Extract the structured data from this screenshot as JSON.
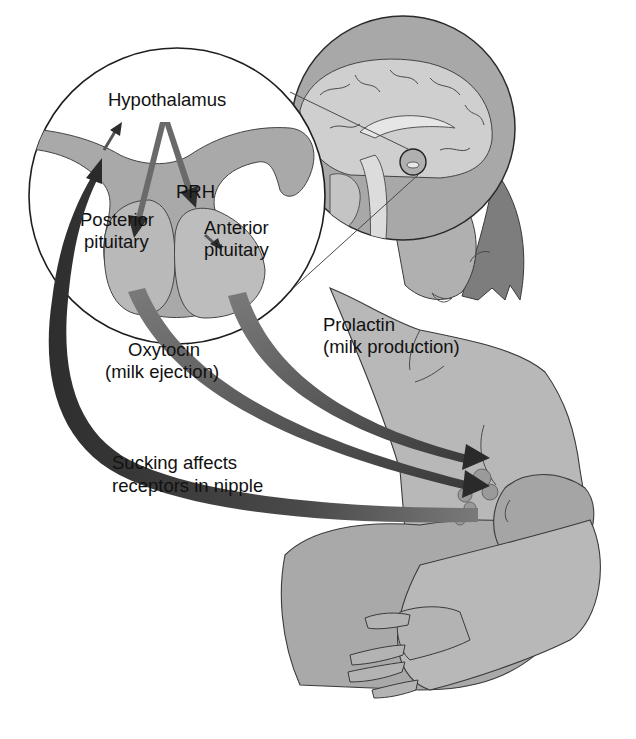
{
  "figure": {
    "labels": {
      "hypothalamus": "Hypothalamus",
      "prh": "PRH",
      "posterior_line1": "Posterior",
      "posterior_line2": "pituitary",
      "anterior_line1": "Anterior",
      "anterior_line2": "pituitary",
      "oxytocin_line1": "Oxytocin",
      "oxytocin_line2": "(milk ejection)",
      "prolactin_line1": "Prolactin",
      "prolactin_line2": "(milk production)",
      "sucking_line1": "Sucking affects",
      "sucking_line2": "receptors in nipple"
    },
    "pathways": [
      {
        "from": "Hypothalamus",
        "to": "Posterior pituitary",
        "type": "neural arrow"
      },
      {
        "from": "Hypothalamus",
        "to": "PRH / Anterior pituitary",
        "type": "releasing hormone arrow"
      },
      {
        "from": "PRH",
        "to": "Anterior pituitary",
        "type": "small arrow"
      },
      {
        "from": "Posterior pituitary",
        "to": "Breast (milk ejection)",
        "hormone": "Oxytocin"
      },
      {
        "from": "Anterior pituitary",
        "to": "Breast (milk production)",
        "hormone": "Prolactin"
      },
      {
        "from": "Nipple receptors",
        "to": "Hypothalamus",
        "stimulus": "Sucking"
      }
    ],
    "colors": {
      "background": "#ffffff",
      "tissue_grey": "#a9a9a9",
      "pituitary_grey": "#b8b8b8",
      "arrow_mid": "#6e6e6e",
      "arrow_dark": "#3a3a3a",
      "skin": "#b5b5b5",
      "hair": "#7d7d7d",
      "brain_light": "#d0d0d0",
      "outline": "#333333"
    }
  }
}
